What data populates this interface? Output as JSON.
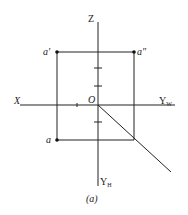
{
  "diagram": {
    "type": "orthographic-projection-of-point",
    "axes": {
      "z_label": "Z",
      "x_label": "X",
      "origin_label": "O",
      "yw_label": "Y",
      "yw_sub": "W",
      "yh_label": "Y",
      "yh_sub": "H"
    },
    "points": {
      "front_view": "a′",
      "side_view": "a″",
      "top_view": "a"
    },
    "caption": "(a)",
    "colors": {
      "line": "#222222",
      "background": "#ffffff"
    }
  }
}
